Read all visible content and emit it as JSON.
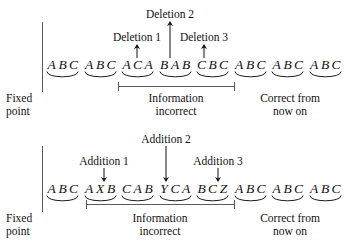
{
  "figure": {
    "type": "frameshift-mutation-reading-frame-diagram",
    "panels": [
      {
        "id": "deletions",
        "fixed_point_label_line1": "Fixed",
        "fixed_point_label_line2": "point",
        "sequence_codons": [
          [
            "A",
            "B",
            "C"
          ],
          [
            "A",
            "B",
            "C"
          ],
          [
            "A",
            "C",
            "A"
          ],
          [
            "B",
            "A",
            "B"
          ],
          [
            "C",
            "B",
            "C"
          ],
          [
            "A",
            "B",
            "C"
          ],
          [
            "A",
            "B",
            "C"
          ],
          [
            "A",
            "B",
            "C"
          ]
        ],
        "sequence_text": "ABC ABC ACA BAB CBC ABC ABC ABC",
        "markers": [
          {
            "label": "Deletion 1",
            "direction": "up",
            "x": 137,
            "label_y": 31,
            "arrow_top": 44,
            "arrow_bottom": 57
          },
          {
            "label": "Deletion 2",
            "direction": "up",
            "x": 170,
            "label_y": 8,
            "arrow_top": 21,
            "arrow_bottom": 57
          },
          {
            "label": "Deletion 3",
            "direction": "up",
            "x": 204,
            "label_y": 31,
            "arrow_top": 44,
            "arrow_bottom": 57
          }
        ],
        "region_bracket": {
          "x1": 118,
          "x2": 234,
          "y": 86
        },
        "region_label_line1": "Information",
        "region_label_line2": "incorrect",
        "correct_label_line1": "Correct from",
        "correct_label_line2": "now on"
      },
      {
        "id": "additions",
        "fixed_point_label_line1": "Fixed",
        "fixed_point_label_line2": "point",
        "sequence_codons": [
          [
            "A",
            "B",
            "C"
          ],
          [
            "A",
            "X",
            "B"
          ],
          [
            "C",
            "A",
            "B"
          ],
          [
            "Y",
            "C",
            "A"
          ],
          [
            "B",
            "C",
            "Z"
          ],
          [
            "A",
            "B",
            "C"
          ],
          [
            "A",
            "B",
            "C"
          ],
          [
            "A",
            "B",
            "C"
          ]
        ],
        "sequence_text": "ABC AXB CAB YCA BCZ ABC ABC ABC",
        "markers": [
          {
            "label": "Addition 1",
            "direction": "down",
            "x": 104,
            "label_y": 29,
            "arrow_top": 42,
            "arrow_bottom": 55
          },
          {
            "label": "Addition 2",
            "direction": "down",
            "x": 166,
            "label_y": 7,
            "arrow_top": 20,
            "arrow_bottom": 55
          },
          {
            "label": "Addition 3",
            "direction": "down",
            "x": 218,
            "label_y": 29,
            "arrow_top": 42,
            "arrow_bottom": 55
          }
        ],
        "region_bracket": {
          "x1": 86,
          "x2": 234,
          "y": 78
        },
        "region_label_line1": "Information",
        "region_label_line2": "incorrect",
        "correct_label_line1": "Correct from",
        "correct_label_line2": "now on"
      }
    ],
    "colors": {
      "ink": "#111111",
      "rule": "#5a5a5a",
      "background": "#ffffff"
    }
  }
}
